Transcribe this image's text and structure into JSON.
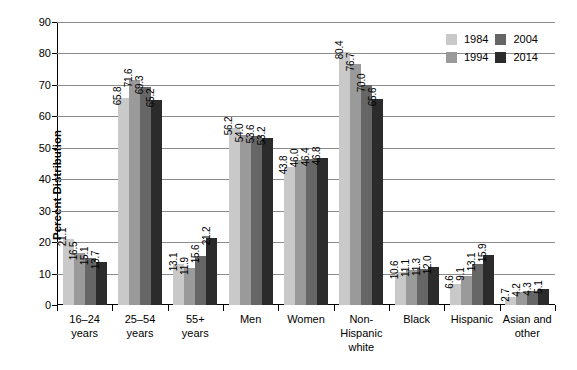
{
  "chart_data": {
    "type": "bar",
    "title": "",
    "xlabel": "",
    "ylabel": "Percent Distribution",
    "ylim": [
      0,
      90
    ],
    "yticks": [
      0,
      10,
      20,
      30,
      40,
      50,
      60,
      70,
      80,
      90
    ],
    "grid": true,
    "legend_position": "top-right",
    "categories": [
      "16–24\nyears",
      "25–54\nyears",
      "55+\nyears",
      "Men",
      "Women",
      "Non-\nHispanic\nwhite",
      "Black",
      "Hispanic",
      "Asian and\nother"
    ],
    "series": [
      {
        "name": "1984",
        "color": "#c9c9c9",
        "values": [
          21.1,
          65.8,
          13.1,
          56.2,
          43.8,
          80.4,
          10.6,
          6.6,
          2.7
        ]
      },
      {
        "name": "1994",
        "color": "#9a9a9a",
        "values": [
          16.5,
          71.6,
          11.9,
          54.0,
          46.0,
          76.7,
          11.1,
          9.1,
          4.2
        ]
      },
      {
        "name": "2004",
        "color": "#666666",
        "values": [
          15.1,
          69.3,
          15.6,
          53.6,
          46.4,
          70.0,
          11.3,
          13.1,
          4.3
        ]
      },
      {
        "name": "2014",
        "color": "#2b2b2b",
        "values": [
          13.7,
          65.2,
          21.2,
          53.2,
          46.8,
          65.6,
          12.0,
          15.9,
          5.1
        ]
      }
    ],
    "value_label_format": "one-decimal",
    "value_labels_rotated": true
  }
}
